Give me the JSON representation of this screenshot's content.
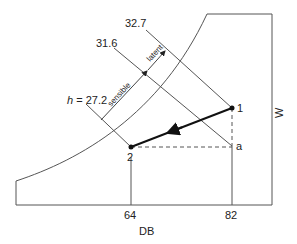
{
  "diagram": {
    "axes": {
      "x_label": "DB",
      "y_label": "W",
      "x_ticks": [
        "64",
        "82"
      ]
    },
    "enthalpy_lines": [
      {
        "label": "h = 27.2",
        "prefix": "h",
        "value": "27.2"
      },
      {
        "label": "31.6",
        "value": "31.6"
      },
      {
        "label": "32.7",
        "value": "32.7"
      }
    ],
    "arrows": {
      "sensible": "sensible",
      "latent": "latent"
    },
    "points": {
      "p1": "1",
      "p2": "2",
      "pa": "a"
    },
    "colors": {
      "line": "#555555",
      "process": "#111111",
      "text": "#222222"
    }
  }
}
